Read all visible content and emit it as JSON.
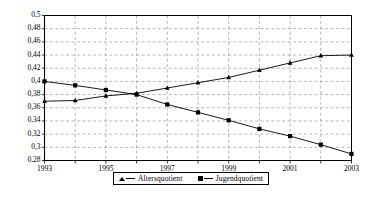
{
  "chart_data": {
    "type": "line",
    "title": "",
    "subtitle": "",
    "xlabel": "",
    "ylabel": "",
    "x": [
      1993,
      1994,
      1995,
      1996,
      1997,
      1998,
      1999,
      2000,
      2001,
      2002,
      2003
    ],
    "xlim": [
      1993,
      2003
    ],
    "ylim": [
      0.28,
      0.5
    ],
    "ytick_step": 0.02,
    "xtick_step": 1,
    "grid": true,
    "grid_style": "dashed",
    "grid_color": "#999999",
    "legend_position": "bottom-center",
    "axis_color": "#000000",
    "decimal_separator": ",",
    "ytick_labels": [
      "0,28",
      "0,3",
      "0,32",
      "0,34",
      "0,36",
      "0,38",
      "0,4",
      "0,42",
      "0,44",
      "0,46",
      "0,48",
      "0,5"
    ],
    "ytick_values": [
      0.28,
      0.3,
      0.32,
      0.34,
      0.36,
      0.38,
      0.4,
      0.42,
      0.44,
      0.46,
      0.48,
      0.5
    ],
    "xtick_labels": [
      "1993",
      "",
      "1995",
      "",
      "1997",
      "",
      "1999",
      "",
      "2001",
      "",
      "2003"
    ],
    "xtick_labels_shown": [
      "1993",
      "1995",
      "1997",
      "1999",
      "2001",
      "2003"
    ],
    "xtick_values_shown": [
      1993,
      1995,
      1997,
      1999,
      2001,
      2003
    ],
    "series": [
      {
        "name": "Altersquotient",
        "marker": "triangle",
        "color": "#000000",
        "values": [
          0.37,
          0.371,
          0.378,
          0.382,
          0.39,
          0.398,
          0.406,
          0.417,
          0.428,
          0.439,
          0.44
        ]
      },
      {
        "name": "Jugendquotient",
        "marker": "square",
        "color": "#000000",
        "values": [
          0.4,
          0.394,
          0.387,
          0.38,
          0.365,
          0.353,
          0.341,
          0.328,
          0.317,
          0.304,
          0.29
        ]
      }
    ]
  },
  "legend": {
    "items": [
      {
        "label": "Altersquotient",
        "marker": "triangle-marker-icon"
      },
      {
        "label": "Jugendquotient",
        "marker": "square-marker-icon"
      }
    ]
  }
}
